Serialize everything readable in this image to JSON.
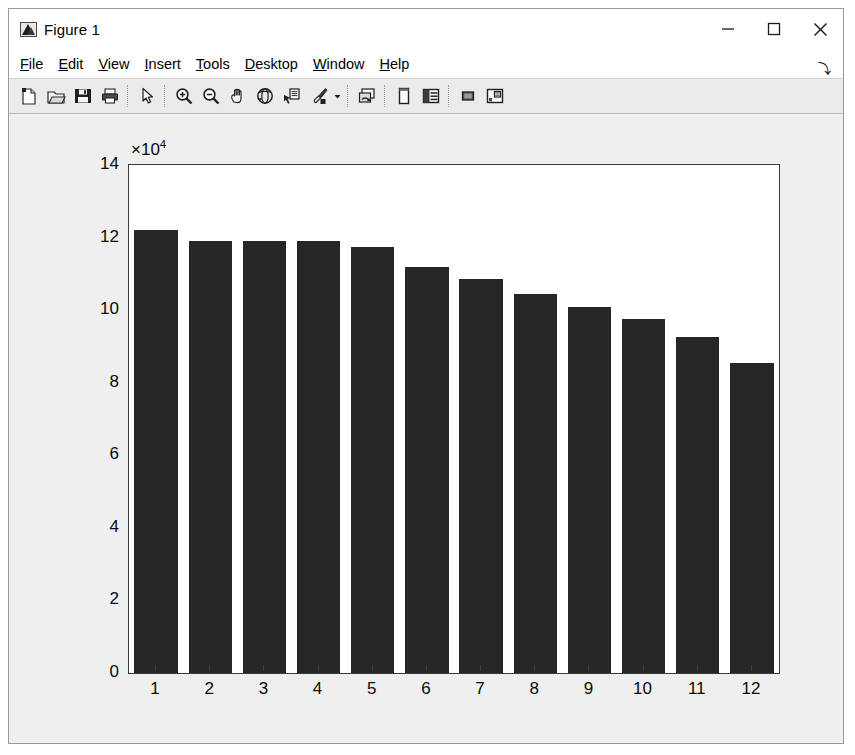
{
  "window": {
    "title": "Figure 1",
    "icon": "matlab-figure-icon",
    "controls": [
      {
        "name": "minimize-button",
        "glyph": "minimize-icon"
      },
      {
        "name": "maximize-button",
        "glyph": "maximize-icon"
      },
      {
        "name": "close-button",
        "glyph": "close-icon"
      }
    ]
  },
  "menubar": {
    "items": [
      {
        "label": "File",
        "mnemonic": "F"
      },
      {
        "label": "Edit",
        "mnemonic": "E"
      },
      {
        "label": "View",
        "mnemonic": "V"
      },
      {
        "label": "Insert",
        "mnemonic": "I"
      },
      {
        "label": "Tools",
        "mnemonic": "T"
      },
      {
        "label": "Desktop",
        "mnemonic": "D"
      },
      {
        "label": "Window",
        "mnemonic": "W"
      },
      {
        "label": "Help",
        "mnemonic": "H"
      }
    ],
    "overflow_glyph": "⤵"
  },
  "toolbar": {
    "buttons": [
      {
        "name": "new-figure-icon",
        "tooltip": "New Figure"
      },
      {
        "name": "open-file-icon",
        "tooltip": "Open File"
      },
      {
        "name": "save-figure-icon",
        "tooltip": "Save Figure"
      },
      {
        "name": "print-figure-icon",
        "tooltip": "Print Figure"
      },
      {
        "name": "separator",
        "tooltip": ""
      },
      {
        "name": "edit-plot-arrow-icon",
        "tooltip": "Edit Plot"
      },
      {
        "name": "separator",
        "tooltip": ""
      },
      {
        "name": "zoom-in-icon",
        "tooltip": "Zoom In"
      },
      {
        "name": "zoom-out-icon",
        "tooltip": "Zoom Out"
      },
      {
        "name": "pan-hand-icon",
        "tooltip": "Pan"
      },
      {
        "name": "rotate-3d-icon",
        "tooltip": "Rotate 3D"
      },
      {
        "name": "data-cursor-icon",
        "tooltip": "Data Cursor"
      },
      {
        "name": "brush-data-icon",
        "tooltip": "Brush/Select Data"
      },
      {
        "name": "brush-dropdown-caret-icon",
        "tooltip": "Brush Options"
      },
      {
        "name": "separator",
        "tooltip": ""
      },
      {
        "name": "link-plot-icon",
        "tooltip": "Link Plot"
      },
      {
        "name": "separator",
        "tooltip": ""
      },
      {
        "name": "figure-palette-icon",
        "tooltip": "Figure Palette"
      },
      {
        "name": "plot-browser-icon",
        "tooltip": "Plot Browser"
      },
      {
        "name": "separator",
        "tooltip": ""
      },
      {
        "name": "property-editor-icon",
        "tooltip": "Property Editor"
      },
      {
        "name": "insert-legend-icon",
        "tooltip": "Insert Legend"
      }
    ]
  },
  "chart_data": {
    "type": "bar",
    "title": "",
    "xlabel": "",
    "ylabel": "",
    "categories": [
      "1",
      "2",
      "3",
      "4",
      "5",
      "6",
      "7",
      "8",
      "9",
      "10",
      "11",
      "12"
    ],
    "values": [
      122000,
      119000,
      119000,
      119000,
      117500,
      112000,
      108500,
      104500,
      101000,
      97500,
      92500,
      85500
    ],
    "y_tick_labels": [
      "0",
      "2",
      "4",
      "6",
      "8",
      "10",
      "12",
      "14"
    ],
    "y_tick_values": [
      0,
      20000,
      40000,
      60000,
      80000,
      100000,
      120000,
      140000
    ],
    "y_multiplier_text": "×10",
    "y_multiplier_exponent": "4",
    "ylim": [
      0,
      140000
    ],
    "xlim": [
      0.5,
      12.5
    ],
    "grid": false,
    "legend": false,
    "bar_color": "#262626",
    "axes_color": "#3b3b3b",
    "background_color": "#ffffff",
    "figure_background_color": "#efefef"
  }
}
